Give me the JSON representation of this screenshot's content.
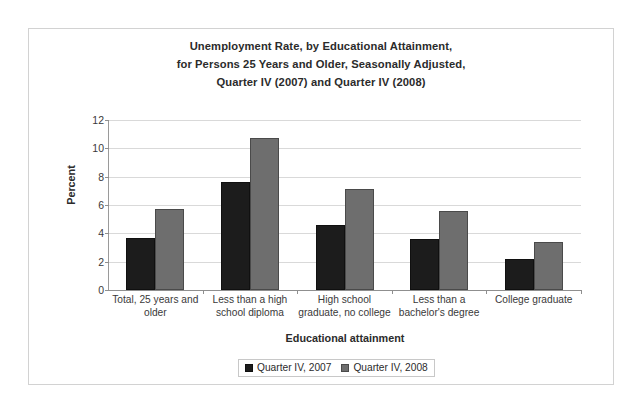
{
  "chart_data": {
    "type": "bar",
    "title": "Unemployment Rate, by Educational Attainment, for Persons 25 Years and Older, Seasonally Adjusted, Quarter IV (2007) and Quarter IV (2008)",
    "title_lines": [
      "Unemployment Rate, by Educational Attainment,",
      "for Persons 25 Years and Older, Seasonally Adjusted,",
      "Quarter IV (2007) and Quarter IV (2008)"
    ],
    "xlabel": "Educational attainment",
    "ylabel": "Percent",
    "ylim": [
      0,
      12
    ],
    "yticks": [
      0,
      2,
      4,
      6,
      8,
      10,
      12
    ],
    "ytick_labels": [
      "0",
      "2",
      "4",
      "6",
      "8",
      "10",
      "12"
    ],
    "grid": true,
    "legend_position": "bottom",
    "categories": [
      "Total, 25 years and older",
      "Less than a high school diploma",
      "High school graduate, no college",
      "Less than a bachelor's degree",
      "College graduate"
    ],
    "category_lines": [
      [
        "Total, 25 years and",
        "older"
      ],
      [
        "Less than a high",
        "school diploma"
      ],
      [
        "High school",
        "graduate, no college"
      ],
      [
        "Less than a",
        "bachelor's degree"
      ],
      [
        "College graduate"
      ]
    ],
    "series": [
      {
        "name": "Quarter IV, 2007",
        "color": "#1c1c1c",
        "values": [
          3.7,
          7.6,
          4.6,
          3.6,
          2.2
        ]
      },
      {
        "name": "Quarter IV, 2008",
        "color": "#6e6e6e",
        "values": [
          5.7,
          10.7,
          7.1,
          5.6,
          3.4
        ]
      }
    ]
  }
}
